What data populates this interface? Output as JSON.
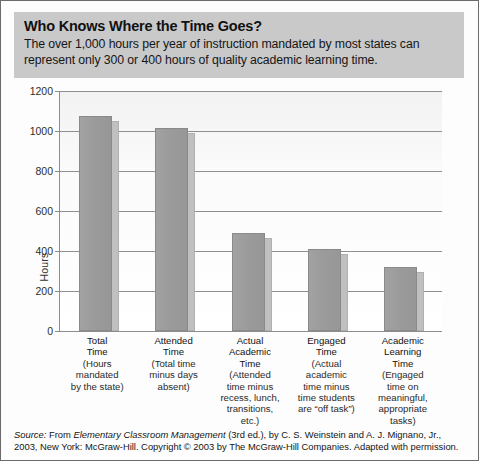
{
  "figure": {
    "frame_color": "#6b6b6b",
    "header": {
      "band_color": "#c9c9c9",
      "title": "Who Knows Where the Time Goes?",
      "subtitle": "The over 1,000 hours per year of instruction mandated by most states can represent only 300 or 400 hours of quality academic learning time."
    },
    "source": {
      "label": "Source:",
      "text_before_italic": " From ",
      "italic_title": "Elementary Classroom Management",
      "text_after": " (3rd ed.), by C. S. Weinstein and A. J. Mignano, Jr., 2003, New York: McGraw-Hill. Copyright © 2003 by The McGraw-Hill Companies. Adapted with permission."
    }
  },
  "chart_data": {
    "type": "bar",
    "title": "Who Knows Where the Time Goes?",
    "xlabel": "",
    "ylabel": "Hours",
    "ylim": [
      0,
      1200
    ],
    "ytick_step": 200,
    "yticks": [
      0,
      200,
      400,
      600,
      800,
      1000,
      1200
    ],
    "ytick_labels": [
      "0",
      "200",
      "400",
      "600",
      "800",
      "1000",
      "1200"
    ],
    "grid": true,
    "legend": null,
    "bar_color": "#9b9b9b",
    "bar_side_color": "#c0c0c0",
    "categories": [
      "Total Time",
      "Attended Time",
      "Actual Academic Time",
      "Engaged Time",
      "Academic Learning Time"
    ],
    "category_lines": [
      [
        "Total",
        "Time",
        "(Hours",
        "mandated",
        "by the state)"
      ],
      [
        "Attended",
        "Time",
        "(Total time",
        "minus days",
        "absent)"
      ],
      [
        "Actual",
        "Academic",
        "Time",
        "(Attended",
        "time minus",
        "recess, lunch,",
        "transitions,",
        "etc.)"
      ],
      [
        "Engaged",
        "Time",
        "(Actual",
        "academic",
        "time minus",
        "time students",
        "are “off task”)"
      ],
      [
        "Academic",
        "Learning",
        "Time",
        "(Engaged",
        "time on",
        "meaningful,",
        "appropriate",
        "tasks)"
      ]
    ],
    "category_name_line_counts": [
      2,
      2,
      3,
      2,
      3
    ],
    "values": [
      1075,
      1015,
      490,
      410,
      320
    ]
  }
}
